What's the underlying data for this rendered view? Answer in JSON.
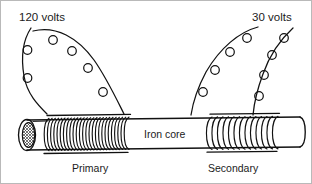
{
  "figure": {
    "kind": "transformer-diagram",
    "width": 312,
    "height": 184,
    "background_color": "#ffffff",
    "border_color": "#b9b9b9",
    "ink_color": "#111111",
    "text_color": "#1b1b1b"
  },
  "labels": {
    "input_voltage": "120 volts",
    "output_voltage": "30 volts",
    "core": "Iron core",
    "primary": "Primary",
    "secondary": "Secondary"
  },
  "components": {
    "core": {
      "name": "Iron core",
      "left_end_style": "hatched-ellipse-cross-section",
      "right_end_style": "rounded-cap"
    },
    "primary_coil": {
      "label": "Primary",
      "turns": 26,
      "winding_density": "dense"
    },
    "secondary_coil": {
      "label": "Secondary",
      "turns": 13,
      "winding_density": "loose"
    },
    "primary_leads": {
      "count": 2,
      "loops_per_lead": [
        3,
        4
      ],
      "label": "120 volts"
    },
    "secondary_leads": {
      "count": 2,
      "loops_per_lead": [
        4,
        4
      ],
      "label": "30 volts"
    }
  }
}
